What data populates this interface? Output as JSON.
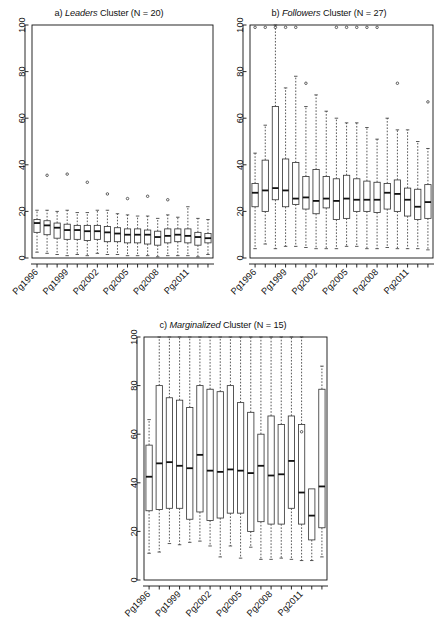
{
  "figure": {
    "background": "#ffffff",
    "foreground": "#111111",
    "box_fill": "#ffffff",
    "box_stroke": "#3a3a3a",
    "median_color": "#111111",
    "whisker_style": "dashed",
    "outlier_symbol": "circle"
  },
  "panels": [
    {
      "id": "panel-a",
      "letter": "a)",
      "cluster_name": "Leaders",
      "title_suffix": "Cluster (N = 20)",
      "title_full": "a) Leaders Cluster (N = 20)",
      "n": 20,
      "chart_data": {
        "type": "box",
        "title": "a) Leaders Cluster (N = 20)",
        "xlabel": "",
        "ylabel": "",
        "ylim": [
          0,
          100
        ],
        "yticks": [
          0,
          20,
          40,
          60,
          80,
          100
        ],
        "ytick_labels": [
          "0",
          "20",
          "40",
          "60",
          "80",
          "100"
        ],
        "grid": false,
        "legend": "none",
        "categories": [
          "Pg1996",
          "Pg1997",
          "Pg1998",
          "Pg1999",
          "Pg2000",
          "Pg2001",
          "Pg2002",
          "Pg2003",
          "Pg2004",
          "Pg2005",
          "Pg2006",
          "Pg2007",
          "Pg2008",
          "Pg2009",
          "Pg2010",
          "Pg2011",
          "Pg2012",
          "Pg2013"
        ],
        "xtick_labels_shown": [
          "Pg1996",
          "Pg1999",
          "Pg2002",
          "Pg2005",
          "Pg2008",
          "Pg2011"
        ],
        "boxes": [
          {
            "category": "Pg1996",
            "lower_whisker": 2.5,
            "q1": 11.0,
            "median": 15.0,
            "q3": 16.5,
            "upper_whisker": 20.5,
            "outliers": []
          },
          {
            "category": "Pg1997",
            "lower_whisker": 2.0,
            "q1": 10.0,
            "median": 14.0,
            "q3": 16.0,
            "upper_whisker": 20.5,
            "outliers": [
              35.5
            ]
          },
          {
            "category": "Pg1998",
            "lower_whisker": 1.5,
            "q1": 8.5,
            "median": 13.0,
            "q3": 15.0,
            "upper_whisker": 20.0,
            "outliers": []
          },
          {
            "category": "Pg1999",
            "lower_whisker": 1.0,
            "q1": 8.0,
            "median": 12.0,
            "q3": 14.5,
            "upper_whisker": 20.5,
            "outliers": [
              36.0
            ]
          },
          {
            "category": "Pg2000",
            "lower_whisker": 1.5,
            "q1": 8.0,
            "median": 12.0,
            "q3": 14.0,
            "upper_whisker": 19.5,
            "outliers": []
          },
          {
            "category": "Pg2001",
            "lower_whisker": 1.0,
            "q1": 7.5,
            "median": 11.5,
            "q3": 14.0,
            "upper_whisker": 19.5,
            "outliers": [
              32.5
            ]
          },
          {
            "category": "Pg2002",
            "lower_whisker": 2.0,
            "q1": 8.0,
            "median": 11.5,
            "q3": 14.0,
            "upper_whisker": 20.5,
            "outliers": []
          },
          {
            "category": "Pg2003",
            "lower_whisker": 1.5,
            "q1": 7.0,
            "median": 11.0,
            "q3": 13.5,
            "upper_whisker": 20.5,
            "outliers": [
              27.5
            ]
          },
          {
            "category": "Pg2004",
            "lower_whisker": 1.5,
            "q1": 7.0,
            "median": 10.5,
            "q3": 13.0,
            "upper_whisker": 19.0,
            "outliers": []
          },
          {
            "category": "Pg2005",
            "lower_whisker": 1.0,
            "q1": 6.5,
            "median": 10.0,
            "q3": 12.5,
            "upper_whisker": 18.5,
            "outliers": [
              25.5
            ]
          },
          {
            "category": "Pg2006",
            "lower_whisker": 1.0,
            "q1": 6.5,
            "median": 10.0,
            "q3": 12.5,
            "upper_whisker": 18.0,
            "outliers": []
          },
          {
            "category": "Pg2007",
            "lower_whisker": 1.0,
            "q1": 6.0,
            "median": 10.0,
            "q3": 12.0,
            "upper_whisker": 18.0,
            "outliers": [
              26.5
            ]
          },
          {
            "category": "Pg2008",
            "lower_whisker": 0.5,
            "q1": 5.5,
            "median": 9.0,
            "q3": 11.5,
            "upper_whisker": 17.0,
            "outliers": []
          },
          {
            "category": "Pg2009",
            "lower_whisker": 1.0,
            "q1": 6.5,
            "median": 9.5,
            "q3": 12.5,
            "upper_whisker": 18.5,
            "outliers": [
              25.0
            ]
          },
          {
            "category": "Pg2010",
            "lower_whisker": 1.0,
            "q1": 7.0,
            "median": 10.0,
            "q3": 12.5,
            "upper_whisker": 17.5,
            "outliers": []
          },
          {
            "category": "Pg2011",
            "lower_whisker": 1.0,
            "q1": 6.5,
            "median": 9.5,
            "q3": 12.5,
            "upper_whisker": 22.0,
            "outliers": []
          },
          {
            "category": "Pg2012",
            "lower_whisker": 0.5,
            "q1": 5.5,
            "median": 9.0,
            "q3": 11.0,
            "upper_whisker": 17.0,
            "outliers": []
          },
          {
            "category": "Pg2013",
            "lower_whisker": 1.5,
            "q1": 6.5,
            "median": 8.5,
            "q3": 10.5,
            "upper_whisker": 16.5,
            "outliers": []
          }
        ]
      }
    },
    {
      "id": "panel-b",
      "letter": "b)",
      "cluster_name": "Followers",
      "title_suffix": "Cluster (N = 27)",
      "title_full": "b) Followers Cluster (N = 27)",
      "n": 27,
      "chart_data": {
        "type": "box",
        "title": "b) Followers Cluster (N = 27)",
        "xlabel": "",
        "ylabel": "",
        "ylim": [
          0,
          100
        ],
        "yticks": [
          0,
          20,
          40,
          60,
          80,
          100
        ],
        "ytick_labels": [
          "0",
          "20",
          "40",
          "60",
          "80",
          "100"
        ],
        "grid": false,
        "legend": "none",
        "categories": [
          "Pg1996",
          "Pg1997",
          "Pg1998",
          "Pg1999",
          "Pg2000",
          "Pg2001",
          "Pg2002",
          "Pg2003",
          "Pg2004",
          "Pg2005",
          "Pg2006",
          "Pg2007",
          "Pg2008",
          "Pg2009",
          "Pg2010",
          "Pg2011",
          "Pg2012",
          "Pg2013"
        ],
        "xtick_labels_shown": [
          "Pg1996",
          "Pg1999",
          "Pg2002",
          "Pg2005",
          "Pg2008",
          "Pg2011"
        ],
        "boxes": [
          {
            "category": "Pg1996",
            "lower_whisker": 4.0,
            "q1": 22.0,
            "median": 28.0,
            "q3": 32.0,
            "upper_whisker": 45.0,
            "outliers": [
              99.0
            ]
          },
          {
            "category": "Pg1997",
            "lower_whisker": 6.0,
            "q1": 20.0,
            "median": 29.0,
            "q3": 42.0,
            "upper_whisker": 57.0,
            "outliers": [
              99.0
            ]
          },
          {
            "category": "Pg1998",
            "lower_whisker": 4.0,
            "q1": 25.0,
            "median": 30.0,
            "q3": 65.0,
            "upper_whisker": 100.0,
            "outliers": [
              99.0
            ]
          },
          {
            "category": "Pg1999",
            "lower_whisker": 5.0,
            "q1": 22.0,
            "median": 29.0,
            "q3": 42.5,
            "upper_whisker": 73.0,
            "outliers": [
              99.0
            ]
          },
          {
            "category": "Pg2000",
            "lower_whisker": 5.0,
            "q1": 23.0,
            "median": 25.5,
            "q3": 41.0,
            "upper_whisker": 78.0,
            "outliers": [
              99.0
            ]
          },
          {
            "category": "Pg2001",
            "lower_whisker": 4.5,
            "q1": 21.0,
            "median": 26.0,
            "q3": 35.0,
            "upper_whisker": 65.0,
            "outliers": [
              75.0
            ]
          },
          {
            "category": "Pg2002",
            "lower_whisker": 4.0,
            "q1": 19.0,
            "median": 24.5,
            "q3": 38.0,
            "upper_whisker": 70.0,
            "outliers": []
          },
          {
            "category": "Pg2003",
            "lower_whisker": 4.0,
            "q1": 21.5,
            "median": 25.5,
            "q3": 35.0,
            "upper_whisker": 63.0,
            "outliers": []
          },
          {
            "category": "Pg2004",
            "lower_whisker": 4.0,
            "q1": 16.5,
            "median": 24.5,
            "q3": 34.0,
            "upper_whisker": 60.0,
            "outliers": [
              99.0
            ]
          },
          {
            "category": "Pg2005",
            "lower_whisker": 5.0,
            "q1": 17.0,
            "median": 25.5,
            "q3": 35.5,
            "upper_whisker": 58.0,
            "outliers": [
              99.0
            ]
          },
          {
            "category": "Pg2006",
            "lower_whisker": 5.0,
            "q1": 20.0,
            "median": 25.0,
            "q3": 34.0,
            "upper_whisker": 58.0,
            "outliers": [
              99.0
            ]
          },
          {
            "category": "Pg2007",
            "lower_whisker": 4.0,
            "q1": 20.0,
            "median": 25.0,
            "q3": 33.0,
            "upper_whisker": 56.0,
            "outliers": [
              99.0
            ]
          },
          {
            "category": "Pg2008",
            "lower_whisker": 4.0,
            "q1": 19.5,
            "median": 25.0,
            "q3": 32.5,
            "upper_whisker": 51.0,
            "outliers": [
              99.0
            ]
          },
          {
            "category": "Pg2009",
            "lower_whisker": 4.5,
            "q1": 21.0,
            "median": 28.0,
            "q3": 32.0,
            "upper_whisker": 60.0,
            "outliers": []
          },
          {
            "category": "Pg2010",
            "lower_whisker": 4.0,
            "q1": 20.0,
            "median": 27.5,
            "q3": 33.5,
            "upper_whisker": 55.0,
            "outliers": [
              75.0
            ]
          },
          {
            "category": "Pg2011",
            "lower_whisker": 4.0,
            "q1": 18.0,
            "median": 25.0,
            "q3": 30.0,
            "upper_whisker": 55.0,
            "outliers": []
          },
          {
            "category": "Pg2012",
            "lower_whisker": 4.0,
            "q1": 16.5,
            "median": 22.0,
            "q3": 29.5,
            "upper_whisker": 50.0,
            "outliers": []
          },
          {
            "category": "Pg2013",
            "lower_whisker": 3.5,
            "q1": 17.0,
            "median": 24.0,
            "q3": 31.5,
            "upper_whisker": 47.0,
            "outliers": [
              67.0
            ]
          }
        ]
      }
    },
    {
      "id": "panel-c",
      "letter": "c)",
      "cluster_name": "Marginalized",
      "title_suffix": "Cluster (N = 15)",
      "title_full": "c) Marginalized Cluster (N = 15)",
      "n": 15,
      "chart_data": {
        "type": "box",
        "title": "c) Marginalized Cluster (N = 15)",
        "xlabel": "",
        "ylabel": "",
        "ylim": [
          0,
          100
        ],
        "yticks": [
          0,
          20,
          40,
          60,
          80,
          100
        ],
        "ytick_labels": [
          "0",
          "20",
          "40",
          "60",
          "80",
          "100"
        ],
        "grid": false,
        "legend": "none",
        "categories": [
          "Pg1996",
          "Pg1997",
          "Pg1998",
          "Pg1999",
          "Pg2000",
          "Pg2001",
          "Pg2002",
          "Pg2003",
          "Pg2004",
          "Pg2005",
          "Pg2006",
          "Pg2007",
          "Pg2008",
          "Pg2009",
          "Pg2010",
          "Pg2011",
          "Pg2012",
          "Pg2013"
        ],
        "xtick_labels_shown": [
          "Pg1996",
          "Pg1999",
          "Pg2002",
          "Pg2005",
          "Pg2008",
          "Pg2011"
        ],
        "boxes": [
          {
            "category": "Pg1996",
            "lower_whisker": 11.0,
            "q1": 28.5,
            "median": 42.5,
            "q3": 55.5,
            "upper_whisker": 66.0,
            "outliers": []
          },
          {
            "category": "Pg1997",
            "lower_whisker": 11.5,
            "q1": 29.0,
            "median": 48.0,
            "q3": 80.0,
            "upper_whisker": 100.0,
            "outliers": []
          },
          {
            "category": "Pg1998",
            "lower_whisker": 15.0,
            "q1": 29.5,
            "median": 48.5,
            "q3": 75.0,
            "upper_whisker": 100.0,
            "outliers": []
          },
          {
            "category": "Pg1999",
            "lower_whisker": 14.5,
            "q1": 29.5,
            "median": 47.0,
            "q3": 74.0,
            "upper_whisker": 100.0,
            "outliers": []
          },
          {
            "category": "Pg2000",
            "lower_whisker": 15.5,
            "q1": 25.0,
            "median": 46.0,
            "q3": 71.0,
            "upper_whisker": 100.0,
            "outliers": []
          },
          {
            "category": "Pg2001",
            "lower_whisker": 16.0,
            "q1": 28.0,
            "median": 51.5,
            "q3": 80.0,
            "upper_whisker": 100.0,
            "outliers": []
          },
          {
            "category": "Pg2002",
            "lower_whisker": 14.0,
            "q1": 24.5,
            "median": 45.0,
            "q3": 78.5,
            "upper_whisker": 100.0,
            "outliers": []
          },
          {
            "category": "Pg2003",
            "lower_whisker": 9.5,
            "q1": 25.5,
            "median": 44.5,
            "q3": 77.5,
            "upper_whisker": 100.0,
            "outliers": []
          },
          {
            "category": "Pg2004",
            "lower_whisker": 14.0,
            "q1": 27.5,
            "median": 45.5,
            "q3": 80.0,
            "upper_whisker": 100.0,
            "outliers": []
          },
          {
            "category": "Pg2005",
            "lower_whisker": 9.0,
            "q1": 27.5,
            "median": 45.0,
            "q3": 73.0,
            "upper_whisker": 100.0,
            "outliers": []
          },
          {
            "category": "Pg2006",
            "lower_whisker": 13.5,
            "q1": 20.0,
            "median": 44.0,
            "q3": 69.0,
            "upper_whisker": 100.0,
            "outliers": []
          },
          {
            "category": "Pg2007",
            "lower_whisker": 8.5,
            "q1": 24.0,
            "median": 47.0,
            "q3": 60.0,
            "upper_whisker": 100.0,
            "outliers": []
          },
          {
            "category": "Pg2008",
            "lower_whisker": 8.5,
            "q1": 23.0,
            "median": 43.0,
            "q3": 67.5,
            "upper_whisker": 100.0,
            "outliers": []
          },
          {
            "category": "Pg2009",
            "lower_whisker": 9.0,
            "q1": 23.0,
            "median": 43.5,
            "q3": 64.0,
            "upper_whisker": 100.0,
            "outliers": []
          },
          {
            "category": "Pg2010",
            "lower_whisker": 8.5,
            "q1": 29.5,
            "median": 49.0,
            "q3": 67.5,
            "upper_whisker": 100.0,
            "outliers": []
          },
          {
            "category": "Pg2011",
            "lower_whisker": 8.0,
            "q1": 23.0,
            "median": 36.0,
            "q3": 64.0,
            "upper_whisker": 100.0,
            "outliers": [
              61.0
            ]
          },
          {
            "category": "Pg2012",
            "lower_whisker": 8.0,
            "q1": 16.5,
            "median": 26.5,
            "q3": 37.5,
            "upper_whisker": null,
            "outliers": []
          },
          {
            "category": "Pg2013",
            "lower_whisker": 9.5,
            "q1": 21.5,
            "median": 38.5,
            "q3": 78.5,
            "upper_whisker": 88.0,
            "outliers": []
          }
        ]
      }
    }
  ]
}
